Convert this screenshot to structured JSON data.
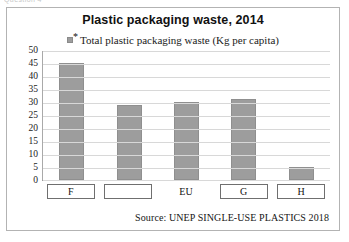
{
  "clipped_header_text": "Question 4",
  "figure": {
    "title": "Plastic packaging waste, 2014",
    "legend": {
      "marker": "legend-swatch-gray",
      "superscript": "*",
      "label": "Total plastic packaging waste (Kg per capita)"
    },
    "source_note": "Source: UNEP SINGLE-USE PLASTICS 2018"
  },
  "chart_data": {
    "type": "bar",
    "title": "Plastic packaging waste, 2014",
    "xlabel": "",
    "ylabel": "",
    "ylim": [
      0,
      50
    ],
    "ytick_step": 5,
    "yticks": [
      50,
      45,
      40,
      35,
      30,
      25,
      20,
      15,
      10,
      5,
      0
    ],
    "grid": true,
    "legend_position": "top-center",
    "series_name": "Total plastic packaging waste (Kg per capita)",
    "bar_color": "#9d9d9d",
    "categories": [
      "F",
      "",
      "EU",
      "G",
      "H"
    ],
    "category_boxed": [
      true,
      true,
      false,
      true,
      true
    ],
    "values": [
      45,
      29,
      30,
      31,
      5
    ],
    "annotations": [
      "Second category label is blank (fill-in-the-blank)"
    ]
  }
}
